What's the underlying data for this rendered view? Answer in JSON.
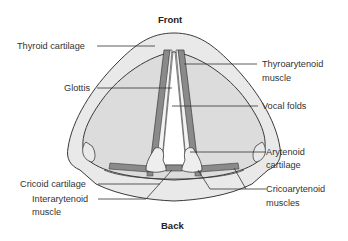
{
  "diagram": {
    "title_top": "Front",
    "title_bottom": "Back",
    "colors": {
      "outline": "#3a3a3a",
      "cartilage_fill": "#e8e8e8",
      "inner_fill": "#dddddd",
      "muscle_fill": "#8a8a8a",
      "glottis_fill": "#ffffff"
    },
    "labels": {
      "thyroid_cartilage": "Thyroid cartilage",
      "glottis": "Glottis",
      "thyroarytenoid_1": "Thyroarytenoid",
      "thyroarytenoid_2": "muscle",
      "vocal_folds": "Vocal folds",
      "arytenoid_1": "Arytenoid",
      "arytenoid_2": "cartilage",
      "cricoid_cartilage": "Cricoid cartilage",
      "interarytenoid_1": "Interarytenoid",
      "interarytenoid_2": "muscle",
      "cricoarytenoid_1": "Cricoarytenoid",
      "cricoarytenoid_2": "muscles"
    }
  }
}
